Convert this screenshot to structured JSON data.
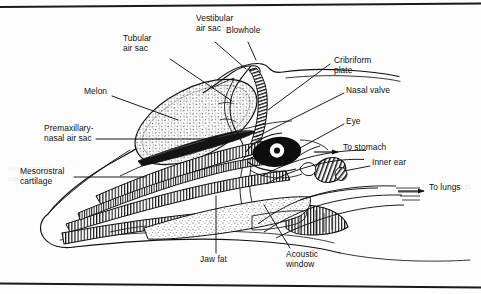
{
  "figure": {
    "frame": {
      "top_rule": true,
      "bottom_rule": true,
      "rule_color": "#1a1a1a"
    },
    "palette": {
      "ink": "#101010",
      "paper": "#fdfdfd",
      "stipple": "#2a2a2a",
      "hatch": "#1a1a1a"
    }
  },
  "labels": [
    {
      "id": "vestibular-air-sac",
      "text": "Vestibular\nair sac",
      "x": 196,
      "y": 19,
      "align": "left"
    },
    {
      "id": "blowhole",
      "text": "Blowhole",
      "x": 226,
      "y": 31,
      "align": "left"
    },
    {
      "id": "tubular-air-sac",
      "text": "Tubular\nair sac",
      "x": 123,
      "y": 39,
      "align": "left"
    },
    {
      "id": "cribriform-plate",
      "text": "Cribriform\nplate",
      "x": 334,
      "y": 61,
      "align": "left"
    },
    {
      "id": "nasal-valve",
      "text": "Nasal valve",
      "x": 346,
      "y": 91,
      "align": "left"
    },
    {
      "id": "melon",
      "text": "Melon",
      "x": 84,
      "y": 92,
      "align": "left"
    },
    {
      "id": "eye",
      "text": "Eye",
      "x": 346,
      "y": 122,
      "align": "left"
    },
    {
      "id": "premaxillary-nasal-air-sac",
      "text": "Premaxillary-\nnasal air sac",
      "x": 44,
      "y": 129,
      "align": "left"
    },
    {
      "id": "to-stomach",
      "text": "To stomach",
      "x": 343,
      "y": 148,
      "align": "left"
    },
    {
      "id": "inner-ear",
      "text": "Inner ear",
      "x": 372,
      "y": 163,
      "align": "left"
    },
    {
      "id": "mesorostral-cartilage",
      "text": "Mesorostral\ncartilage",
      "x": 20,
      "y": 172,
      "align": "left"
    },
    {
      "id": "to-lungs",
      "text": "To lungs",
      "x": 429,
      "y": 188,
      "align": "left"
    },
    {
      "id": "jaw-fat",
      "text": "Jaw fat",
      "x": 200,
      "y": 260,
      "align": "left"
    },
    {
      "id": "acoustic-window",
      "text": "Acoustic\nwindow",
      "x": 286,
      "y": 255,
      "align": "left"
    }
  ],
  "structures": [
    {
      "id": "head-outline",
      "name": "Head and rostrum outline",
      "fill": "none"
    },
    {
      "id": "melon-body",
      "name": "Melon",
      "fill": "stipple"
    },
    {
      "id": "premaxillary-sac",
      "name": "Premaxillary-nasal air sac",
      "fill": "solid"
    },
    {
      "id": "nasal-passage",
      "name": "Nasal passage / blowhole",
      "fill": "hatch"
    },
    {
      "id": "upper-jaw-bone",
      "name": "Upper jaw (maxilla)",
      "fill": "hatch"
    },
    {
      "id": "lower-jaw-bone",
      "name": "Lower jaw (mandible)",
      "fill": "hatch"
    },
    {
      "id": "mesorostral-core",
      "name": "Mesorostral cartilage",
      "fill": "hatch"
    },
    {
      "id": "jaw-fat-body",
      "name": "Jaw fat channel",
      "fill": "stipple"
    },
    {
      "id": "inner-ear-bulla",
      "name": "Inner ear (tympanic bulla)",
      "fill": "hatch"
    },
    {
      "id": "eye-globe",
      "name": "Eye",
      "fill": "solid"
    },
    {
      "id": "acoustic-window-pane",
      "name": "Acoustic window",
      "fill": "none"
    },
    {
      "id": "airway-to-lungs",
      "name": "Airway to lungs",
      "fill": "none"
    },
    {
      "id": "tract-to-stomach",
      "name": "Tract to stomach",
      "fill": "none"
    }
  ],
  "arrows": [
    {
      "id": "arrow-to-stomach",
      "label_ref": "to-stomach",
      "direction": "right"
    },
    {
      "id": "arrow-to-lungs",
      "label_ref": "to-lungs",
      "direction": "right"
    }
  ],
  "ghost_text": [
    {
      "id": "ghost-left",
      "text": "Mesorostral\ncartilage",
      "x": 8,
      "y": 168
    },
    {
      "id": "ghost-right",
      "text": "lungs",
      "x": 452,
      "y": 186
    }
  ]
}
